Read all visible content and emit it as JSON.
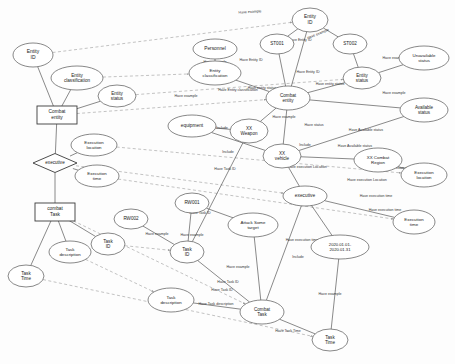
{
  "diagram": {
    "type": "entity-relationship-knowledge-graph",
    "colors": {
      "node_stroke": "#555555",
      "strong_stroke": "#3a3a3a",
      "solid_edge": "#4a4a4a",
      "dashed_edge": "#9a9a9a",
      "background": "#fdfdfd",
      "text": "#1a1a1a"
    },
    "nodes": [
      {
        "id": "n_entity_id_l",
        "label": "Entity ID",
        "shape": "ellipse",
        "x": 33,
        "y": 55,
        "rx": 20,
        "ry": 12,
        "fs": 5.0,
        "lines": [
          "Entity",
          "ID"
        ]
      },
      {
        "id": "n_entity_class_l",
        "label": "Entity classification",
        "shape": "ellipse",
        "x": 77,
        "y": 78,
        "rx": 26,
        "ry": 12,
        "fs": 4.6,
        "lines": [
          "Entity",
          "classification"
        ]
      },
      {
        "id": "n_entity_status_l",
        "label": "Entity status",
        "shape": "ellipse",
        "x": 117,
        "y": 96,
        "rx": 19,
        "ry": 11,
        "fs": 4.6,
        "lines": [
          "Entity",
          "status"
        ]
      },
      {
        "id": "n_combat_entity",
        "label": "Combat entity",
        "shape": "rect",
        "x": 57,
        "y": 115,
        "w": 40,
        "h": 18,
        "fs": 4.8,
        "lines": [
          "Combat",
          "entity"
        ]
      },
      {
        "id": "n_exec_loc_l",
        "label": "Execution location",
        "shape": "ellipse",
        "x": 94,
        "y": 145,
        "rx": 23,
        "ry": 11,
        "fs": 4.4,
        "lines": [
          "Execution",
          "location"
        ]
      },
      {
        "id": "n_executive_l",
        "label": "executive",
        "shape": "diamond",
        "x": 55,
        "y": 163,
        "w": 44,
        "h": 19,
        "fs": 4.6,
        "lines": [
          "executive"
        ]
      },
      {
        "id": "n_exec_time_l",
        "label": "Execution time",
        "shape": "ellipse",
        "x": 97,
        "y": 176,
        "rx": 22,
        "ry": 11,
        "fs": 4.4,
        "lines": [
          "Execution",
          "time"
        ]
      },
      {
        "id": "n_combat_task_l",
        "label": "combat Task",
        "shape": "rect",
        "x": 55,
        "y": 212,
        "w": 40,
        "h": 18,
        "fs": 4.8,
        "lines": [
          "combat",
          "Task"
        ]
      },
      {
        "id": "n_task_desc_l",
        "label": "Task description",
        "shape": "ellipse",
        "x": 70,
        "y": 252,
        "rx": 21,
        "ry": 11,
        "fs": 4.4,
        "lines": [
          "Task",
          "description"
        ]
      },
      {
        "id": "n_task_id_l",
        "label": "Task ID",
        "shape": "ellipse",
        "x": 108,
        "y": 244,
        "rx": 17,
        "ry": 11,
        "fs": 4.6,
        "lines": [
          "Task",
          "ID"
        ]
      },
      {
        "id": "n_task_time_l",
        "label": "Task Time",
        "shape": "ellipse",
        "x": 26,
        "y": 276,
        "rx": 18,
        "ry": 11,
        "fs": 4.6,
        "lines": [
          "Task",
          "Time"
        ]
      },
      {
        "id": "n_personnel",
        "label": "Personnel",
        "shape": "ellipse",
        "x": 215,
        "y": 49,
        "rx": 22,
        "ry": 10,
        "fs": 4.8,
        "lines": [
          "Personnel"
        ]
      },
      {
        "id": "n_st001",
        "label": "ST001",
        "shape": "ellipse",
        "x": 277,
        "y": 44,
        "rx": 17,
        "ry": 10,
        "fs": 4.6,
        "lines": [
          "ST001"
        ]
      },
      {
        "id": "n_entity_id_r",
        "label": "Entity ID",
        "shape": "ellipse",
        "x": 310,
        "y": 20,
        "rx": 18,
        "ry": 12,
        "fs": 4.8,
        "lines": [
          "Entity",
          "ID"
        ]
      },
      {
        "id": "n_st002",
        "label": "ST002",
        "shape": "ellipse",
        "x": 350,
        "y": 44,
        "rx": 17,
        "ry": 10,
        "fs": 4.6,
        "lines": [
          "ST002"
        ]
      },
      {
        "id": "n_entity_class_r",
        "label": "Entity classification",
        "shape": "ellipse",
        "x": 215,
        "y": 73,
        "rx": 26,
        "ry": 12,
        "fs": 4.4,
        "lines": [
          "Entity",
          "classification"
        ]
      },
      {
        "id": "n_entity_status_r",
        "label": "Entity status",
        "shape": "ellipse",
        "x": 362,
        "y": 78,
        "rx": 19,
        "ry": 11,
        "fs": 4.6,
        "lines": [
          "Entity",
          "status"
        ]
      },
      {
        "id": "n_unavailable_status",
        "label": "Unavailable status",
        "shape": "ellipse",
        "x": 424,
        "y": 58,
        "rx": 25,
        "ry": 12,
        "fs": 4.4,
        "lines": [
          "Unavailable",
          "status"
        ]
      },
      {
        "id": "n_available_status",
        "label": "Available status",
        "shape": "ellipse",
        "x": 424,
        "y": 110,
        "rx": 24,
        "ry": 12,
        "fs": 4.5,
        "lines": [
          "Available",
          "status"
        ]
      },
      {
        "id": "n_combat_entity_r",
        "label": "Combat entity",
        "shape": "ellipse",
        "x": 288,
        "y": 98,
        "rx": 22,
        "ry": 12,
        "fs": 4.6,
        "lines": [
          "Combat",
          "entity"
        ]
      },
      {
        "id": "n_equipment",
        "label": "equipment",
        "shape": "ellipse",
        "x": 192,
        "y": 126,
        "rx": 24,
        "ry": 11,
        "fs": 4.8,
        "lines": [
          "equipment"
        ]
      },
      {
        "id": "n_xx_weapon",
        "label": "XX Weapon",
        "shape": "ellipse",
        "x": 249,
        "y": 131,
        "rx": 19,
        "ry": 12,
        "fs": 4.6,
        "lines": [
          "XX",
          "Weapon"
        ]
      },
      {
        "id": "n_xx_vehicle",
        "label": "XX vehicle",
        "shape": "ellipse",
        "x": 282,
        "y": 156,
        "rx": 19,
        "ry": 12,
        "fs": 4.6,
        "lines": [
          "XX",
          "vehicle"
        ]
      },
      {
        "id": "n_xx_combat_region",
        "label": "XX Combat Region",
        "shape": "ellipse",
        "x": 378,
        "y": 160,
        "rx": 24,
        "ry": 12,
        "fs": 4.4,
        "lines": [
          "XX Combat",
          "Region"
        ]
      },
      {
        "id": "n_exec_loc_r",
        "label": "Execution location",
        "shape": "ellipse",
        "x": 424,
        "y": 175,
        "rx": 23,
        "ry": 12,
        "fs": 4.4,
        "lines": [
          "Execution",
          "location"
        ]
      },
      {
        "id": "n_executive_r",
        "label": "executive",
        "shape": "ellipse",
        "x": 305,
        "y": 196,
        "rx": 22,
        "ry": 10,
        "fs": 4.8,
        "lines": [
          "executive"
        ]
      },
      {
        "id": "n_exec_time_r",
        "label": "Execution time",
        "shape": "ellipse",
        "x": 414,
        "y": 222,
        "rx": 21,
        "ry": 12,
        "fs": 4.4,
        "lines": [
          "Execution",
          "time"
        ]
      },
      {
        "id": "n_rw001",
        "label": "RW001",
        "shape": "ellipse",
        "x": 192,
        "y": 203,
        "rx": 17,
        "ry": 10,
        "fs": 4.6,
        "lines": [
          "RW001"
        ]
      },
      {
        "id": "n_rw002",
        "label": "RW002",
        "shape": "ellipse",
        "x": 131,
        "y": 219,
        "rx": 17,
        "ry": 10,
        "fs": 4.6,
        "lines": [
          "RW002"
        ]
      },
      {
        "id": "n_attack_target",
        "label": "Attack Some target",
        "shape": "ellipse",
        "x": 253,
        "y": 225,
        "rx": 25,
        "ry": 12,
        "fs": 4.4,
        "lines": [
          "Attack Some",
          "target"
        ]
      },
      {
        "id": "n_task_id_m",
        "label": "Task ID",
        "shape": "ellipse",
        "x": 187,
        "y": 252,
        "rx": 17,
        "ry": 11,
        "fs": 4.6,
        "lines": [
          "Task",
          "ID"
        ]
      },
      {
        "id": "n_date_range",
        "label": "2020.01.01-2020.01.31",
        "shape": "ellipse",
        "x": 340,
        "y": 247,
        "rx": 29,
        "ry": 12,
        "fs": 4.2,
        "lines": [
          "2020.01.01-",
          "2020.01.31"
        ]
      },
      {
        "id": "n_task_desc_m",
        "label": "Task description",
        "shape": "ellipse",
        "x": 171,
        "y": 300,
        "rx": 23,
        "ry": 12,
        "fs": 4.4,
        "lines": [
          "Task",
          "description"
        ]
      },
      {
        "id": "n_combat_task_r",
        "label": "Combat Task",
        "shape": "ellipse",
        "x": 262,
        "y": 312,
        "rx": 22,
        "ry": 12,
        "fs": 4.6,
        "lines": [
          "Combat",
          "Task"
        ]
      },
      {
        "id": "n_task_time_r",
        "label": "Task Time",
        "shape": "ellipse",
        "x": 330,
        "y": 340,
        "rx": 18,
        "ry": 11,
        "fs": 4.6,
        "lines": [
          "Task",
          "Time"
        ]
      }
    ],
    "edge_labels": [
      {
        "text": "Have example",
        "x": 250,
        "y": 12,
        "rot": -3
      },
      {
        "text": "Have example",
        "x": 215,
        "y": 62,
        "rot": 0
      },
      {
        "text": "Have Entity ID",
        "x": 300,
        "y": 40,
        "rot": 0
      },
      {
        "text": "Have example",
        "x": 318,
        "y": 34,
        "rot": -22
      },
      {
        "text": "Have Entity ID",
        "x": 251,
        "y": 60,
        "rot": 0
      },
      {
        "text": "Have Entity ID",
        "x": 308,
        "y": 72,
        "rot": 0
      },
      {
        "text": "Have entity status",
        "x": 262,
        "y": 88,
        "rot": 0
      },
      {
        "text": "Have example",
        "x": 394,
        "y": 58,
        "rot": 0
      },
      {
        "text": "Have example",
        "x": 394,
        "y": 93,
        "rot": 0
      },
      {
        "text": "Have entity status",
        "x": 330,
        "y": 84,
        "rot": 0
      },
      {
        "text": "Have Entity classification",
        "x": 238,
        "y": 90,
        "rot": 0
      },
      {
        "text": "Have example",
        "x": 186,
        "y": 96,
        "rot": 0
      },
      {
        "text": "Have example",
        "x": 284,
        "y": 117,
        "rot": 0
      },
      {
        "text": "Have Available status",
        "x": 366,
        "y": 130,
        "rot": 0
      },
      {
        "text": "Have Available status",
        "x": 355,
        "y": 146,
        "rot": 0
      },
      {
        "text": "Have status",
        "x": 314,
        "y": 125,
        "rot": 0
      },
      {
        "text": "Include",
        "x": 222,
        "y": 128,
        "rot": 0
      },
      {
        "text": "Include",
        "x": 228,
        "y": 152,
        "rot": 0
      },
      {
        "text": "Include",
        "x": 305,
        "y": 145,
        "rot": 0
      },
      {
        "text": "Have execution Location",
        "x": 307,
        "y": 167,
        "rot": 0
      },
      {
        "text": "Have execution Location",
        "x": 367,
        "y": 180,
        "rot": 0
      },
      {
        "text": "Have example",
        "x": 398,
        "y": 168,
        "rot": 0
      },
      {
        "text": "Have execution time",
        "x": 376,
        "y": 196,
        "rot": 0
      },
      {
        "text": "Have execution time",
        "x": 385,
        "y": 210,
        "rot": 0
      },
      {
        "text": "Have Task ID",
        "x": 225,
        "y": 169,
        "rot": 0
      },
      {
        "text": "Have Task ID",
        "x": 200,
        "y": 213,
        "rot": 0
      },
      {
        "text": "Have Task ID",
        "x": 228,
        "y": 282,
        "rot": 0
      },
      {
        "text": "Have Task ID",
        "x": 222,
        "y": 290,
        "rot": 0
      },
      {
        "text": "Have example",
        "x": 157,
        "y": 234,
        "rot": 0
      },
      {
        "text": "Have example",
        "x": 192,
        "y": 235,
        "rot": 0
      },
      {
        "text": "Have example",
        "x": 238,
        "y": 267,
        "rot": 0
      },
      {
        "text": "Have execution time",
        "x": 302,
        "y": 240,
        "rot": 0
      },
      {
        "text": "Include",
        "x": 298,
        "y": 257,
        "rot": 0
      },
      {
        "text": "Have example",
        "x": 330,
        "y": 294,
        "rot": 0
      },
      {
        "text": "Have Task description",
        "x": 216,
        "y": 304,
        "rot": 0
      },
      {
        "text": "Have Task Time",
        "x": 288,
        "y": 331,
        "rot": 0
      }
    ],
    "solid_edges": [
      [
        "n_entity_id_l",
        "n_combat_entity"
      ],
      [
        "n_entity_class_l",
        "n_combat_entity"
      ],
      [
        "n_entity_status_l",
        "n_combat_entity"
      ],
      [
        "n_combat_entity",
        "n_executive_l"
      ],
      [
        "n_executive_l",
        "n_exec_loc_l"
      ],
      [
        "n_executive_l",
        "n_exec_time_l"
      ],
      [
        "n_executive_l",
        "n_combat_task_l"
      ],
      [
        "n_combat_task_l",
        "n_task_desc_l"
      ],
      [
        "n_combat_task_l",
        "n_task_id_l"
      ],
      [
        "n_combat_task_l",
        "n_task_time_l"
      ],
      [
        "n_personnel",
        "n_entity_class_r"
      ],
      [
        "n_st001",
        "n_entity_id_r"
      ],
      [
        "n_st002",
        "n_entity_id_r"
      ],
      [
        "n_st001",
        "n_combat_entity_r"
      ],
      [
        "n_st002",
        "n_entity_status_r"
      ],
      [
        "n_entity_id_r",
        "n_combat_entity_r"
      ],
      [
        "n_entity_status_r",
        "n_unavailable_status"
      ],
      [
        "n_entity_status_r",
        "n_combat_entity_r"
      ],
      [
        "n_entity_class_r",
        "n_combat_entity_r"
      ],
      [
        "n_available_status",
        "n_xx_vehicle"
      ],
      [
        "n_available_status",
        "n_combat_entity_r"
      ],
      [
        "n_equipment",
        "n_xx_weapon"
      ],
      [
        "n_equipment",
        "n_xx_vehicle"
      ],
      [
        "n_combat_entity_r",
        "n_xx_weapon"
      ],
      [
        "n_combat_entity_r",
        "n_xx_vehicle"
      ],
      [
        "n_xx_vehicle",
        "n_xx_combat_region"
      ],
      [
        "n_xx_combat_region",
        "n_exec_loc_r"
      ],
      [
        "n_xx_vehicle",
        "n_executive_r"
      ],
      [
        "n_executive_r",
        "n_exec_time_r"
      ],
      [
        "n_executive_r",
        "n_date_range"
      ],
      [
        "n_rw001",
        "n_task_id_m"
      ],
      [
        "n_rw002",
        "n_task_id_m"
      ],
      [
        "n_rw001",
        "n_attack_target"
      ],
      [
        "n_attack_target",
        "n_combat_task_r"
      ],
      [
        "n_task_id_m",
        "n_combat_task_r"
      ],
      [
        "n_task_desc_m",
        "n_combat_task_r"
      ],
      [
        "n_task_time_r",
        "n_combat_task_r"
      ],
      [
        "n_date_range",
        "n_task_time_r"
      ],
      [
        "n_executive_r",
        "n_combat_task_r"
      ],
      [
        "n_xx_weapon",
        "n_task_id_m"
      ]
    ],
    "dashed_edges": [
      [
        "n_entity_id_l",
        "n_entity_id_r"
      ],
      [
        "n_entity_class_l",
        "n_entity_class_r"
      ],
      [
        "n_entity_status_l",
        "n_entity_status_r"
      ],
      [
        "n_combat_entity",
        "n_combat_entity_r"
      ],
      [
        "n_exec_loc_l",
        "n_exec_loc_r"
      ],
      [
        "n_executive_l",
        "n_executive_r"
      ],
      [
        "n_exec_time_l",
        "n_exec_time_r"
      ],
      [
        "n_combat_task_l",
        "n_combat_task_r"
      ],
      [
        "n_task_id_l",
        "n_task_id_m"
      ],
      [
        "n_task_desc_l",
        "n_task_desc_m"
      ],
      [
        "n_task_time_l",
        "n_task_time_r"
      ]
    ]
  }
}
